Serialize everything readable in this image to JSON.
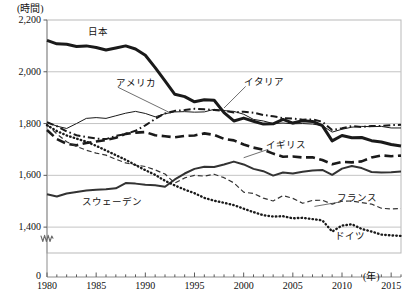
{
  "chart_data": {
    "type": "line",
    "title": "",
    "subtitle": "",
    "xlabel": "(年)",
    "ylabel": "(時間)",
    "xlim": [
      1980,
      2016
    ],
    "ylim": [
      1300,
      2200
    ],
    "y_axis_break": true,
    "y_zero_label": "0",
    "grid": "horizontal",
    "legend_position": "inline-annotations",
    "yticks": [
      1400,
      1600,
      1800,
      2000,
      2200
    ],
    "ytick_labels": [
      "1,400",
      "1,600",
      "1,800",
      "2,000",
      "2,200"
    ],
    "xticks": [
      1980,
      1985,
      1990,
      1995,
      2000,
      2005,
      2010,
      2015
    ],
    "xtick_labels": [
      "1980",
      "1985",
      "1990",
      "1995",
      "2000",
      "2005",
      "2010",
      "2015"
    ],
    "x_minor_ticks": true,
    "x": [
      1980,
      1981,
      1982,
      1983,
      1984,
      1985,
      1986,
      1987,
      1988,
      1989,
      1990,
      1991,
      1992,
      1993,
      1994,
      1995,
      1996,
      1997,
      1998,
      1999,
      2000,
      2001,
      2002,
      2003,
      2004,
      2005,
      2006,
      2007,
      2008,
      2009,
      2010,
      2011,
      2012,
      2013,
      2014,
      2015,
      2016
    ],
    "series": [
      {
        "name": "日本",
        "name_en": "Japan",
        "style": "solid",
        "width": 3.0,
        "color": "#1a1a1a",
        "label_x": 1984.2,
        "label_y": 2150,
        "values": [
          2121,
          2108,
          2106,
          2098,
          2100,
          2094,
          2084,
          2092,
          2100,
          2088,
          2064,
          2016,
          1965,
          1913,
          1904,
          1884,
          1892,
          1890,
          1842,
          1810,
          1821,
          1809,
          1798,
          1799,
          1816,
          1802,
          1811,
          1808,
          1792,
          1733,
          1754,
          1745,
          1746,
          1734,
          1729,
          1719,
          1713
        ]
      },
      {
        "name": "アメリカ",
        "name_en": "United States",
        "style": "solid",
        "width": 1.0,
        "color": "#1a1a1a",
        "label_x": 1987.0,
        "label_y": 1952,
        "leader_to_x": 1992.6,
        "leader_to_y": 1840,
        "values": [
          1805,
          1790,
          1781,
          1800,
          1820,
          1823,
          1820,
          1830,
          1840,
          1847,
          1839,
          1826,
          1838,
          1845,
          1846,
          1844,
          1845,
          1855,
          1850,
          1847,
          1836,
          1816,
          1810,
          1800,
          1802,
          1799,
          1800,
          1798,
          1792,
          1767,
          1778,
          1786,
          1789,
          1788,
          1789,
          1783,
          1783
        ]
      },
      {
        "name": "イタリア",
        "name_en": "Italy",
        "style": "dashdot",
        "width": 2.0,
        "color": "#1a1a1a",
        "label_x": 2000.0,
        "label_y": 1955,
        "leader_to_x": 1998.0,
        "leader_to_y": 1860,
        "values": [
          1805,
          1790,
          1770,
          1755,
          1748,
          1742,
          1740,
          1752,
          1760,
          1772,
          1793,
          1818,
          1839,
          1849,
          1852,
          1857,
          1855,
          1852,
          1849,
          1843,
          1846,
          1842,
          1833,
          1828,
          1821,
          1819,
          1815,
          1816,
          1807,
          1775,
          1782,
          1790,
          1787,
          1791,
          1791,
          1794,
          1795
        ]
      },
      {
        "name": "イギリス",
        "name_en": "United Kingdom",
        "style": "dashed-heavy",
        "width": 2.6,
        "color": "#1a1a1a",
        "label_x": 2002.3,
        "label_y": 1712,
        "leader_to_x": 2000.0,
        "leader_to_y": 1668,
        "values": [
          1775,
          1740,
          1722,
          1716,
          1725,
          1731,
          1736,
          1745,
          1760,
          1765,
          1767,
          1755,
          1751,
          1747,
          1752,
          1754,
          1762,
          1756,
          1741,
          1735,
          1719,
          1707,
          1699,
          1684,
          1672,
          1673,
          1669,
          1670,
          1659,
          1643,
          1652,
          1650,
          1654,
          1669,
          1677,
          1674,
          1676
        ]
      },
      {
        "name": "スウェーデン",
        "name_en": "Sweden",
        "style": "solid",
        "width": 2.0,
        "color": "#333333",
        "label_x": 1983.6,
        "label_y": 1492,
        "values": [
          1527,
          1518,
          1530,
          1536,
          1541,
          1544,
          1546,
          1550,
          1570,
          1568,
          1564,
          1562,
          1556,
          1584,
          1607,
          1625,
          1633,
          1632,
          1642,
          1653,
          1642,
          1625,
          1616,
          1599,
          1611,
          1607,
          1614,
          1619,
          1621,
          1602,
          1626,
          1636,
          1628,
          1613,
          1611,
          1612,
          1615
        ]
      },
      {
        "name": "フランス",
        "name_en": "France",
        "style": "dashed-light",
        "width": 1.2,
        "color": "#333333",
        "label_x": 2009.5,
        "label_y": 1508,
        "leader_to_x": 2007.2,
        "leader_to_y": 1480,
        "values": [
          1796,
          1760,
          1730,
          1712,
          1697,
          1686,
          1678,
          1662,
          1648,
          1640,
          1634,
          1621,
          1605,
          1570,
          1590,
          1600,
          1597,
          1604,
          1591,
          1571,
          1535,
          1530,
          1512,
          1501,
          1522,
          1511,
          1492,
          1503,
          1504,
          1489,
          1500,
          1501,
          1495,
          1489,
          1473,
          1470,
          1472
        ]
      },
      {
        "name": "ドイツ",
        "name_en": "Germany",
        "style": "dotted",
        "width": 2.4,
        "color": "#1a1a1a",
        "label_x": 2009.3,
        "label_y": 1362,
        "values": [
          1794,
          1771,
          1754,
          1742,
          1730,
          1714,
          1696,
          1678,
          1660,
          1640,
          1620,
          1602,
          1579,
          1561,
          1545,
          1531,
          1513,
          1502,
          1494,
          1485,
          1471,
          1458,
          1446,
          1441,
          1442,
          1434,
          1436,
          1431,
          1426,
          1383,
          1406,
          1411,
          1393,
          1383,
          1371,
          1368,
          1366
        ]
      }
    ]
  },
  "labels": {
    "y_unit": "(時間)",
    "x_unit": "(年)",
    "zero": "0"
  }
}
